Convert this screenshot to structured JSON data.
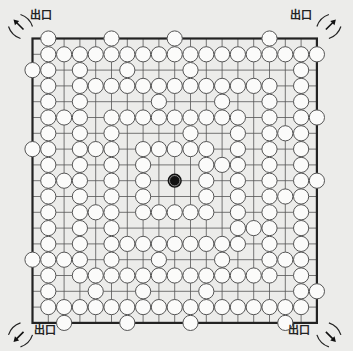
{
  "puzzle": {
    "type": "go-board-maze",
    "grid_size": 19,
    "exit_label": "出口",
    "exits": [
      {
        "corner": "top-left",
        "label": "出口",
        "direction": "up-left"
      },
      {
        "corner": "top-right",
        "label": "出口",
        "direction": "up-right"
      },
      {
        "corner": "bottom-left",
        "label": "出口",
        "direction": "down-left"
      },
      {
        "corner": "bottom-right",
        "label": "出口",
        "direction": "down-right"
      }
    ],
    "black_stone": {
      "col": 9,
      "row": 9
    },
    "white_stones_by_row": [
      [
        1,
        5,
        9,
        15
      ],
      [
        1,
        2,
        3,
        4,
        5,
        6,
        7,
        8,
        9,
        10,
        11,
        12,
        13,
        14,
        15,
        16,
        17,
        18
      ],
      [
        0,
        1,
        3,
        6,
        10,
        17
      ],
      [
        1,
        3,
        4,
        5,
        6,
        7,
        8,
        9,
        10,
        11,
        12,
        13,
        14,
        15,
        17
      ],
      [
        1,
        3,
        8,
        12,
        15,
        17
      ],
      [
        1,
        2,
        3,
        5,
        6,
        7,
        8,
        9,
        10,
        11,
        12,
        13,
        15,
        17,
        18
      ],
      [
        1,
        3,
        5,
        10,
        13,
        15,
        16,
        17
      ],
      [
        0,
        1,
        3,
        4,
        5,
        7,
        8,
        9,
        10,
        11,
        13,
        15,
        17
      ],
      [
        1,
        3,
        5,
        7,
        11,
        12,
        13,
        15,
        17
      ],
      [
        1,
        2,
        3,
        5,
        7,
        11,
        13,
        15,
        17,
        18
      ],
      [
        1,
        3,
        5,
        7,
        11,
        13,
        15,
        16,
        17
      ],
      [
        1,
        3,
        4,
        5,
        7,
        8,
        9,
        10,
        11,
        13,
        15,
        17
      ],
      [
        1,
        3,
        5,
        13,
        14,
        15,
        17
      ],
      [
        1,
        3,
        5,
        6,
        7,
        8,
        9,
        10,
        11,
        12,
        13,
        15,
        17
      ],
      [
        0,
        1,
        2,
        3,
        5,
        8,
        12,
        15,
        16,
        17
      ],
      [
        1,
        3,
        4,
        5,
        6,
        7,
        8,
        9,
        10,
        11,
        12,
        13,
        14,
        15,
        17
      ],
      [
        1,
        4,
        7,
        11,
        17,
        18
      ],
      [
        1,
        2,
        3,
        4,
        5,
        6,
        7,
        8,
        9,
        10,
        11,
        12,
        13,
        14,
        15,
        16,
        17
      ],
      [
        2,
        6,
        10,
        16
      ]
    ],
    "colors": {
      "background": "#ececea",
      "board_line": "#555555",
      "border": "#222222",
      "white_stone_fill": "#fbfbfa",
      "white_stone_stroke": "#555555",
      "black_stone": "#111111"
    }
  }
}
